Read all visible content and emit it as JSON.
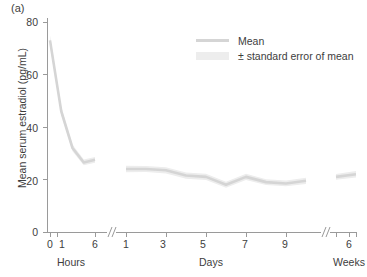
{
  "figure": {
    "panel_label": "(a)",
    "background_color": "#ffffff",
    "mean_line_color": "#d5d5d5",
    "sem_band_color": "#ededed",
    "axis_color": "#9a9a9a",
    "text_color": "#3d3d3d"
  },
  "legend": {
    "position": "top-right",
    "entries": [
      {
        "label": "Mean",
        "marker": "line",
        "color": "#d5d5d5"
      },
      {
        "label": "± standard error of  mean",
        "marker": "band",
        "color": "#ededed"
      }
    ]
  },
  "axes": {
    "y_title": "Mean serum estradiol (pg/mL)",
    "y_ticks": [
      0,
      20,
      40,
      60,
      80
    ],
    "y_tick_labels": [
      "0",
      "20",
      "40",
      "60",
      "80"
    ],
    "y_lim": [
      0,
      80
    ],
    "x_group_labels": [
      "Hours",
      "Days",
      "Weeks"
    ],
    "x_tick_labels_hours": [
      "0",
      "1",
      "6"
    ],
    "x_tick_labels_days": [
      "1",
      "3",
      "5",
      "7",
      "9"
    ],
    "x_tick_labels_weeks": [
      "6"
    ],
    "axis_breaks": 2,
    "grid": "off"
  },
  "chart_data": {
    "type": "line",
    "title": "",
    "xlabel": "",
    "ylabel": "Mean serum estradiol (pg/mL)",
    "ylim": [
      0,
      80
    ],
    "grid": false,
    "legend_position": "top-right",
    "x_axis_units": [
      "Hours",
      "Days",
      "Weeks"
    ],
    "x_axis_has_breaks": true,
    "segments": [
      {
        "unit": "Hours",
        "x": [
          0,
          1,
          2,
          4,
          6
        ],
        "x_tick_labels": [
          "0",
          "1",
          "",
          "",
          "6"
        ],
        "mean": [
          73.0,
          46.0,
          32.0,
          26.5,
          27.5
        ],
        "sem_upper": [
          75.0,
          47.5,
          33.2,
          27.6,
          28.6
        ],
        "sem_lower": [
          71.0,
          44.5,
          30.8,
          25.4,
          26.4
        ]
      },
      {
        "unit": "Days",
        "x": [
          1,
          2,
          3,
          4,
          5,
          6,
          7,
          8,
          9,
          10
        ],
        "x_tick_labels": [
          "1",
          "",
          "3",
          "",
          "5",
          "",
          "7",
          "",
          "9",
          ""
        ],
        "mean": [
          24.0,
          24.0,
          23.5,
          21.5,
          21.0,
          18.0,
          21.0,
          19.0,
          18.5,
          19.5
        ],
        "sem_upper": [
          25.2,
          25.1,
          24.7,
          22.7,
          22.2,
          19.1,
          22.2,
          20.1,
          19.6,
          20.7
        ],
        "sem_lower": [
          22.8,
          22.9,
          22.3,
          20.3,
          19.8,
          16.9,
          19.8,
          17.9,
          17.4,
          18.3
        ]
      },
      {
        "unit": "Weeks",
        "x": [
          6
        ],
        "x_tick_labels": [
          "6"
        ],
        "mean": [
          21.0,
          22.0
        ],
        "sem_upper": [
          22.1,
          23.2
        ],
        "sem_lower": [
          19.9,
          20.8
        ]
      }
    ],
    "series": [
      {
        "name": "Mean",
        "values": [
          73.0,
          46.0,
          32.0,
          26.5,
          27.5,
          24.0,
          24.0,
          23.5,
          21.5,
          21.0,
          18.0,
          21.0,
          19.0,
          18.5,
          19.5,
          21.0,
          22.0
        ]
      },
      {
        "name": "± standard error of  mean",
        "values_upper": [
          75.0,
          47.5,
          33.2,
          27.6,
          28.6,
          25.2,
          25.1,
          24.7,
          22.7,
          22.2,
          19.1,
          22.2,
          20.1,
          19.6,
          20.7,
          22.1,
          23.2
        ],
        "values_lower": [
          71.0,
          44.5,
          30.8,
          25.4,
          26.4,
          22.8,
          22.9,
          22.3,
          20.3,
          19.8,
          16.9,
          19.8,
          17.9,
          17.4,
          18.3,
          19.9,
          20.8
        ]
      }
    ]
  }
}
